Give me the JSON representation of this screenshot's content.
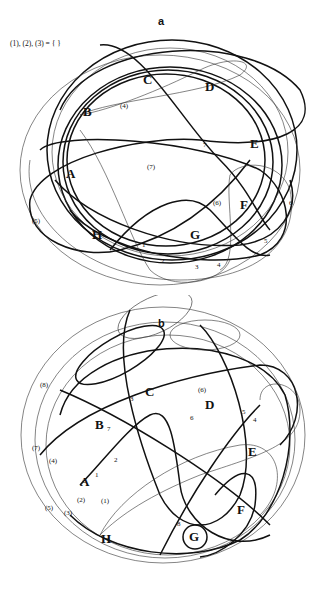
{
  "panel_a": {
    "title": "a",
    "empty_set_note": "(1), (2), (3) = { }",
    "region_labels": [
      "A",
      "B",
      "C",
      "D",
      "E",
      "F",
      "G",
      "H"
    ],
    "curve_labels": [
      "1",
      "2",
      "3",
      "4",
      "5",
      "6",
      "7"
    ],
    "dual_labels": [
      "(4)",
      "(5)",
      "(6)",
      "(7)"
    ],
    "labels": {
      "A": "A",
      "B": "B",
      "C": "C",
      "D": "D",
      "E": "E",
      "F": "F",
      "G": "G",
      "H": "H",
      "n1": "1",
      "n2": "2",
      "n3": "3",
      "n4": "4",
      "n5": "5",
      "n6": "6",
      "n7": "7",
      "p4": "(4)",
      "p5": "(5)",
      "p6": "(6)",
      "p7": "(7)"
    }
  },
  "panel_b": {
    "title": "b",
    "labels": {
      "A": "A",
      "B": "B",
      "C": "C",
      "D": "D",
      "E": "E",
      "F": "F",
      "G": "G",
      "H": "H",
      "n1": "1",
      "n2": "2",
      "n3": "3",
      "n4": "4",
      "n5": "5",
      "n6": "6",
      "n7": "7",
      "n8": "8",
      "p1": "(1)",
      "p2": "(2)",
      "p3": "(3)",
      "p4": "(4)",
      "p5": "(5)",
      "p6": "(6)",
      "p7": "(7)",
      "p8": "(8)"
    }
  },
  "colors": {
    "stroke": "#111111",
    "background": "#ffffff"
  }
}
